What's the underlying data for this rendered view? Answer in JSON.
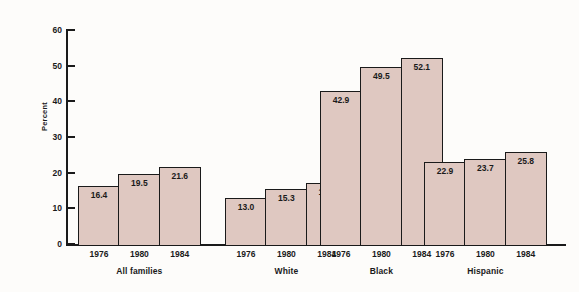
{
  "chart_data": {
    "type": "bar",
    "title": "",
    "xlabel": "",
    "ylabel": "Percent",
    "ylim": [
      0,
      60
    ],
    "yticks": [
      0,
      10,
      20,
      30,
      40,
      50,
      60
    ],
    "ytick_labels": [
      "0",
      "10",
      "20",
      "30",
      "40",
      "50",
      "60"
    ],
    "grid": false,
    "legend": "none",
    "categories": [
      "All families",
      "White",
      "Black",
      "Hispanic"
    ],
    "x": [
      "1976",
      "1980",
      "1984"
    ],
    "series": [
      {
        "name": "1976",
        "values": [
          16.4,
          13.0,
          42.9,
          22.9
        ]
      },
      {
        "name": "1980",
        "values": [
          19.5,
          15.3,
          49.5,
          23.7
        ]
      },
      {
        "name": "1984",
        "values": [
          21.6,
          17.2,
          52.1,
          25.8
        ]
      }
    ],
    "groups": [
      {
        "label": "All families",
        "bars": [
          {
            "year": "1976",
            "value": 16.4,
            "value_label": "16.4"
          },
          {
            "year": "1980",
            "value": 19.5,
            "value_label": "19.5"
          },
          {
            "year": "1984",
            "value": 21.6,
            "value_label": "21.6"
          }
        ]
      },
      {
        "label": "White",
        "bars": [
          {
            "year": "1976",
            "value": 13.0,
            "value_label": "13.0"
          },
          {
            "year": "1980",
            "value": 15.3,
            "value_label": "15.3"
          },
          {
            "year": "1984",
            "value": 17.2,
            "value_label": "17.2"
          }
        ]
      },
      {
        "label": "Black",
        "bars": [
          {
            "year": "1976",
            "value": 42.9,
            "value_label": "42.9"
          },
          {
            "year": "1980",
            "value": 49.5,
            "value_label": "49.5"
          },
          {
            "year": "1984",
            "value": 52.1,
            "value_label": "52.1"
          }
        ]
      },
      {
        "label": "Hispanic",
        "bars": [
          {
            "year": "1976",
            "value": 22.9,
            "value_label": "22.9"
          },
          {
            "year": "1980",
            "value": 23.7,
            "value_label": "23.7"
          },
          {
            "year": "1984",
            "value": 25.8,
            "value_label": "25.8"
          }
        ]
      }
    ],
    "colors": {
      "bar_fill": "#dfc8c1",
      "bar_border": "#1a1a1a",
      "axis": "#1a1a1a",
      "background": "#fdfcfa",
      "text": "#1a1a1a"
    }
  }
}
